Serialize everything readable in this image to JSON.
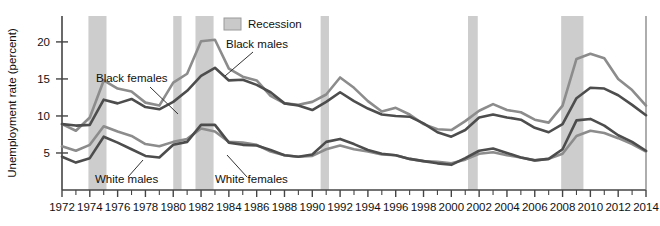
{
  "chart_data": {
    "type": "line",
    "title": "",
    "xlabel": "",
    "ylabel": "Unemployment rate (percent)",
    "xlim": [
      1972,
      2014
    ],
    "ylim": [
      0,
      23.5
    ],
    "yticks": [
      5,
      10,
      15,
      20
    ],
    "ytick_labels": [
      "5",
      "10",
      "15",
      "20"
    ],
    "xticks": [
      1972,
      1974,
      1976,
      1978,
      1980,
      1982,
      1984,
      1986,
      1988,
      1990,
      1992,
      1994,
      1996,
      1998,
      2000,
      2002,
      2004,
      2006,
      2008,
      2010,
      2012,
      2014
    ],
    "xtick_labels": [
      "1972",
      "1974",
      "1976",
      "1978",
      "1980",
      "1982",
      "1984",
      "1986",
      "1988",
      "1990",
      "1992",
      "1994",
      "1996",
      "1998",
      "2000",
      "2002",
      "2004",
      "2006",
      "2008",
      "2010",
      "2012",
      "2014"
    ],
    "xminor_step": 1,
    "grid": false,
    "legend": {
      "position": "top-center",
      "entries": [
        {
          "label": "Recession",
          "swatch_color": "#c9c9c9",
          "type": "band"
        }
      ]
    },
    "x": [
      1972,
      1973,
      1974,
      1975,
      1976,
      1977,
      1978,
      1979,
      1980,
      1981,
      1982,
      1983,
      1984,
      1985,
      1986,
      1987,
      1988,
      1989,
      1990,
      1991,
      1992,
      1993,
      1994,
      1995,
      1996,
      1997,
      1998,
      1999,
      2000,
      2001,
      2002,
      2003,
      2004,
      2005,
      2006,
      2007,
      2008,
      2009,
      2010,
      2011,
      2012,
      2013,
      2014
    ],
    "series": [
      {
        "name": "Black males",
        "color": "#8c8c8c",
        "linewidth": 2.6,
        "values": [
          8.9,
          8.0,
          9.8,
          14.8,
          13.7,
          13.3,
          11.8,
          11.4,
          14.5,
          15.7,
          20.1,
          20.3,
          16.4,
          15.3,
          14.8,
          12.7,
          11.7,
          11.5,
          11.9,
          12.9,
          15.2,
          13.8,
          12.0,
          10.6,
          11.1,
          10.2,
          8.9,
          8.2,
          8.1,
          9.3,
          10.7,
          11.6,
          10.8,
          10.5,
          9.5,
          9.1,
          11.4,
          17.7,
          18.4,
          17.8,
          15.0,
          13.5,
          11.4
        ]
      },
      {
        "name": "Black females",
        "color": "#4d4d4d",
        "linewidth": 2.6,
        "values": [
          8.9,
          8.7,
          8.8,
          12.2,
          11.7,
          12.3,
          11.2,
          10.9,
          11.9,
          13.4,
          15.4,
          16.5,
          14.8,
          14.9,
          14.2,
          13.2,
          11.7,
          11.4,
          10.8,
          11.9,
          13.2,
          12.0,
          11.0,
          10.2,
          10.0,
          9.9,
          9.0,
          7.8,
          7.2,
          8.1,
          9.8,
          10.2,
          9.8,
          9.5,
          8.4,
          7.8,
          8.9,
          12.4,
          13.8,
          13.7,
          12.8,
          11.5,
          10.1
        ]
      },
      {
        "name": "White males",
        "color": "#4d4d4d",
        "linewidth": 2.6,
        "values": [
          4.5,
          3.7,
          4.3,
          7.2,
          6.4,
          5.5,
          4.6,
          4.4,
          6.1,
          6.5,
          8.8,
          8.8,
          6.4,
          6.1,
          6.0,
          5.4,
          4.7,
          4.5,
          4.8,
          6.5,
          6.9,
          6.2,
          5.4,
          4.9,
          4.7,
          4.2,
          3.9,
          3.6,
          3.4,
          4.3,
          5.3,
          5.6,
          5.0,
          4.4,
          4.0,
          4.2,
          5.5,
          9.4,
          9.6,
          8.7,
          7.4,
          6.5,
          5.3
        ]
      },
      {
        "name": "White females",
        "color": "#8c8c8c",
        "linewidth": 2.6,
        "values": [
          5.9,
          5.3,
          6.1,
          8.6,
          7.9,
          7.3,
          6.2,
          5.9,
          6.5,
          6.9,
          8.3,
          7.9,
          6.5,
          6.4,
          6.1,
          5.2,
          4.7,
          4.5,
          4.6,
          5.5,
          6.0,
          5.5,
          5.2,
          4.8,
          4.7,
          4.2,
          3.9,
          3.8,
          3.6,
          4.1,
          4.9,
          5.1,
          4.7,
          4.4,
          4.0,
          4.2,
          4.9,
          7.3,
          8.0,
          7.7,
          7.0,
          6.2,
          5.2
        ]
      }
    ],
    "recessions": [
      {
        "start": 1973.9,
        "end": 1975.2
      },
      {
        "start": 1980.0,
        "end": 1980.6
      },
      {
        "start": 1981.6,
        "end": 1982.9
      },
      {
        "start": 1990.6,
        "end": 1991.2
      },
      {
        "start": 2001.2,
        "end": 2001.9
      },
      {
        "start": 2007.9,
        "end": 2009.5
      }
    ],
    "annotations": [
      {
        "text": "Black females",
        "x_px": 96,
        "y_px": 82,
        "leader": [
          [
            150,
            87
          ],
          [
            178,
            114
          ]
        ]
      },
      {
        "text": "Black males",
        "x_px": 226,
        "y_px": 48,
        "leader": [
          [
            253,
            52
          ],
          [
            225,
            76
          ]
        ]
      },
      {
        "text": "White males",
        "x_px": 95,
        "y_px": 183,
        "leader": [
          [
            128,
            177
          ],
          [
            143,
            160
          ]
        ]
      },
      {
        "text": "White females",
        "x_px": 215,
        "y_px": 183,
        "leader": [
          [
            247,
            177
          ],
          [
            227,
            155
          ]
        ]
      }
    ]
  }
}
